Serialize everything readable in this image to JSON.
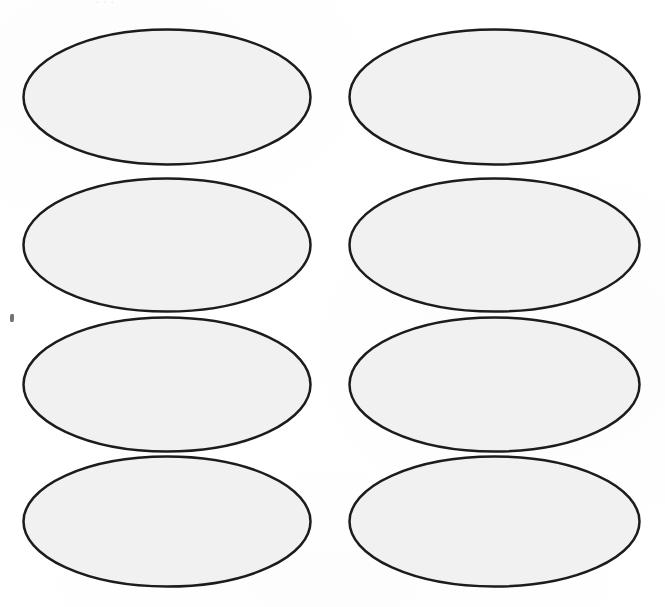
{
  "document": {
    "title": "Oval Label Template Sheet",
    "page_width": 665,
    "page_height": 607,
    "background_color": "#ffffff",
    "scan_artifact_note": ""
  },
  "style": {
    "oval_fill_color": "#f1f1f1",
    "oval_stroke_color": "#1c1c1c",
    "oval_stroke_width": 2.5
  },
  "grid": {
    "columns": 2,
    "rows": 4,
    "total_shapes": 8
  },
  "shapes": [
    {
      "id": "oval-r1c1",
      "row": 1,
      "column": 1,
      "label": "",
      "x": 22,
      "y": 28,
      "width": 290,
      "height": 138
    },
    {
      "id": "oval-r1c2",
      "row": 1,
      "column": 2,
      "label": "",
      "x": 348,
      "y": 28,
      "width": 293,
      "height": 138
    },
    {
      "id": "oval-r2c1",
      "row": 2,
      "column": 1,
      "label": "",
      "x": 22,
      "y": 177,
      "width": 290,
      "height": 136
    },
    {
      "id": "oval-r2c2",
      "row": 2,
      "column": 2,
      "label": "",
      "x": 348,
      "y": 177,
      "width": 293,
      "height": 136
    },
    {
      "id": "oval-r3c1",
      "row": 3,
      "column": 1,
      "label": "",
      "x": 22,
      "y": 316,
      "width": 290,
      "height": 137
    },
    {
      "id": "oval-r3c2",
      "row": 3,
      "column": 2,
      "label": "",
      "x": 348,
      "y": 316,
      "width": 293,
      "height": 137
    },
    {
      "id": "oval-r4c1",
      "row": 4,
      "column": 1,
      "label": "",
      "x": 22,
      "y": 455,
      "width": 290,
      "height": 133
    },
    {
      "id": "oval-r4c2",
      "row": 4,
      "column": 2,
      "label": "",
      "x": 348,
      "y": 455,
      "width": 293,
      "height": 133
    }
  ],
  "artifacts": {
    "top_ghost_text": "·  · ·",
    "ghost_marks": [
      {
        "text": "· · · ·",
        "x": 120,
        "y": 72
      },
      {
        "text": "· · · · ·",
        "x": 168,
        "y": 96
      },
      {
        "text": "· · · ·",
        "x": 96,
        "y": 130
      },
      {
        "text": "· · · ·",
        "x": 430,
        "y": 70
      },
      {
        "text": "· · ·",
        "x": 486,
        "y": 98
      },
      {
        "text": "· · · ·",
        "x": 120,
        "y": 222
      },
      {
        "text": "· · ·",
        "x": 420,
        "y": 238
      },
      {
        "text": "· · · ·",
        "x": 140,
        "y": 380
      },
      {
        "text": "· · ·",
        "x": 470,
        "y": 372
      }
    ],
    "speck": {
      "x": 10,
      "y": 314,
      "width": 4,
      "height": 8
    }
  }
}
